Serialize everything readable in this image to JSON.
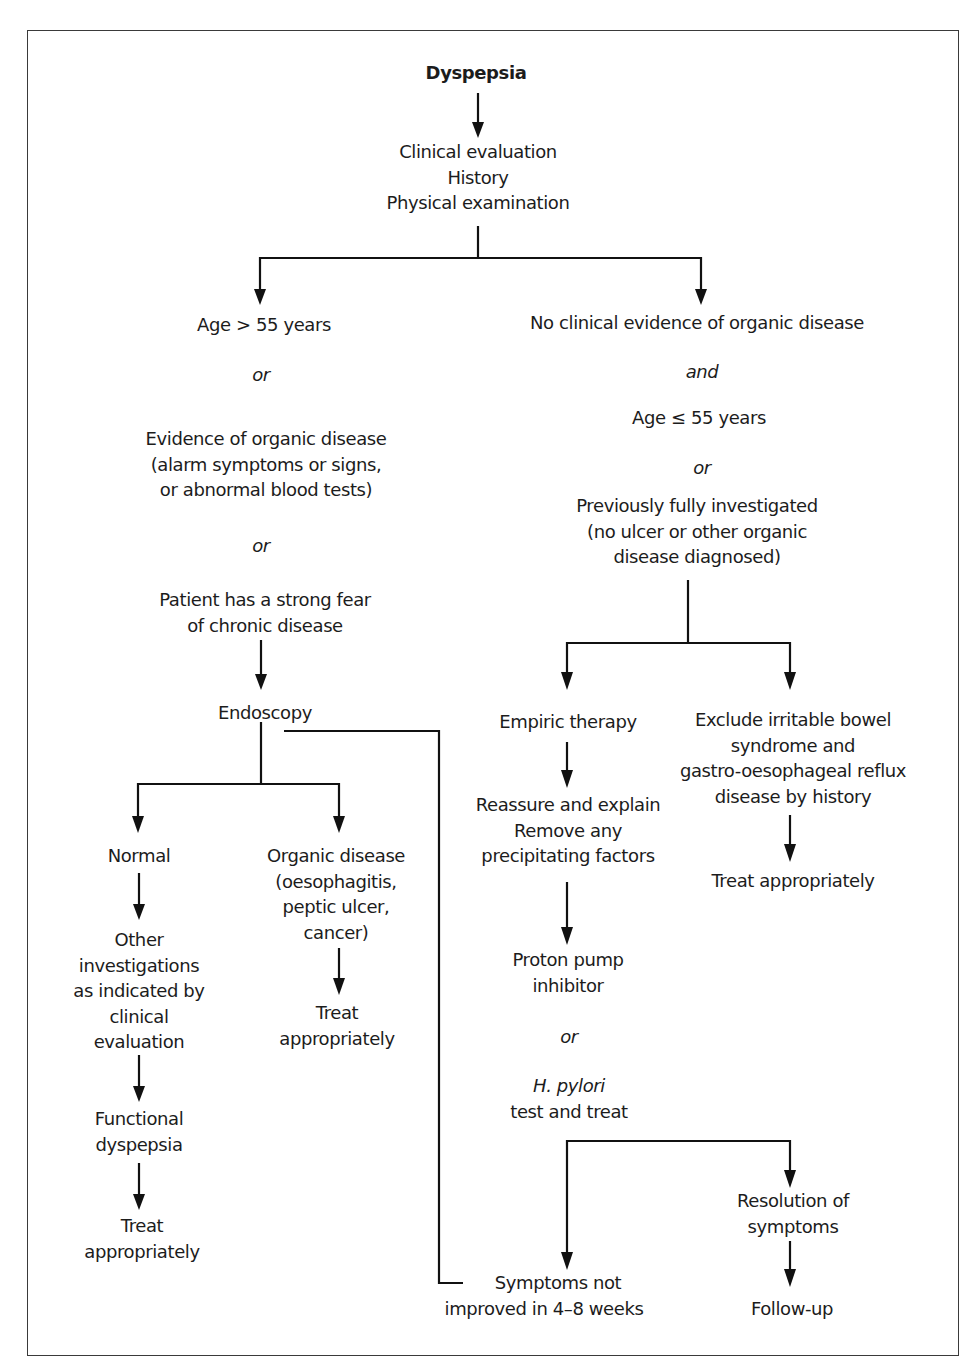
{
  "diagram": {
    "title": "Dyspepsia",
    "type": "flowchart",
    "colors": {
      "line": "#111111",
      "text": "#1c1c1c",
      "frame": "#3a3a3a",
      "background": "#ffffff"
    },
    "nodes": {
      "root": {
        "lines": [
          "Dyspepsia"
        ]
      },
      "clinical_evaluation": {
        "lines": [
          "Clinical evaluation",
          "History",
          "Physical examination"
        ]
      },
      "left_criteria": {
        "age_over": {
          "lines": [
            "Age > 55 years"
          ]
        },
        "or_1": "or",
        "organic_evidence": {
          "lines": [
            "Evidence of organic disease",
            "(alarm symptoms or signs,",
            "or abnormal blood tests)"
          ]
        },
        "or_2": "or",
        "fear": {
          "lines": [
            "Patient has a strong fear",
            "of chronic disease"
          ]
        }
      },
      "right_criteria": {
        "no_evidence": {
          "lines": [
            "No clinical evidence of organic disease"
          ]
        },
        "and": "and",
        "age_under": {
          "lines": [
            "Age ≤ 55 years"
          ]
        },
        "or": "or",
        "previously_investigated": {
          "lines": [
            "Previously fully investigated",
            "(no ulcer or other organic",
            "disease diagnosed)"
          ]
        }
      },
      "endoscopy": {
        "lines": [
          "Endoscopy"
        ]
      },
      "normal": {
        "lines": [
          "Normal"
        ]
      },
      "other_investigations": {
        "lines": [
          "Other",
          "investigations",
          "as indicated by",
          "clinical",
          "evaluation"
        ]
      },
      "functional_dyspepsia": {
        "lines": [
          "Functional",
          "dyspepsia"
        ]
      },
      "treat_left": {
        "lines": [
          "Treat",
          "appropriately"
        ]
      },
      "organic_disease": {
        "lines": [
          "Organic disease",
          "(oesophagitis,",
          "peptic ulcer,",
          "cancer)"
        ]
      },
      "treat_organic": {
        "lines": [
          "Treat",
          "appropriately"
        ]
      },
      "empiric_therapy": {
        "lines": [
          "Empiric therapy"
        ]
      },
      "reassure": {
        "lines": [
          "Reassure and explain",
          "Remove any",
          "precipitating factors"
        ]
      },
      "ppi": {
        "lines": [
          "Proton pump",
          "inhibitor"
        ]
      },
      "or_ppi": "or",
      "hpylori": {
        "italic": "H. pylori",
        "rest": "test and treat"
      },
      "exclude_ibs": {
        "lines": [
          "Exclude irritable bowel",
          "syndrome and",
          "gastro-oesophageal reflux",
          "disease by history"
        ]
      },
      "treat_right": {
        "lines": [
          "Treat appropriately"
        ]
      },
      "resolution": {
        "lines": [
          "Resolution of",
          "symptoms"
        ]
      },
      "follow_up": {
        "lines": [
          "Follow-up"
        ]
      },
      "not_improved": {
        "lines": [
          "Symptoms not",
          "improved in 4–8 weeks"
        ]
      }
    }
  }
}
